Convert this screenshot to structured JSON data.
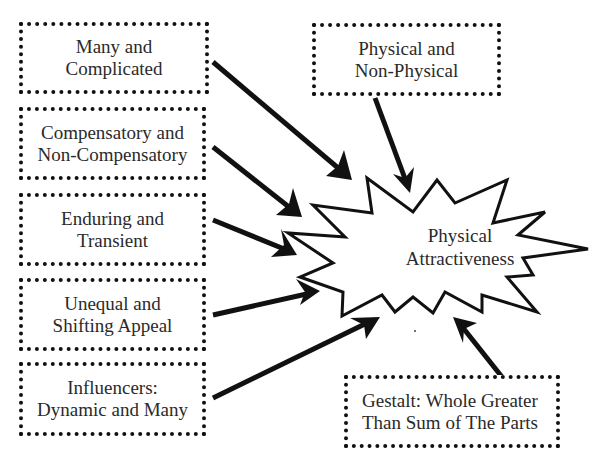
{
  "diagram": {
    "center": {
      "line1": "Physical",
      "line2": "Attractiveness",
      "shape": "starburst"
    },
    "factors": [
      {
        "id": "many",
        "line1": "Many and",
        "line2": "Complicated"
      },
      {
        "id": "compensatory",
        "line1": "Compensatory and",
        "line2": "Non-Compensatory"
      },
      {
        "id": "enduring",
        "line1": "Enduring and",
        "line2": "Transient"
      },
      {
        "id": "unequal",
        "line1": "Unequal and",
        "line2": "Shifting Appeal"
      },
      {
        "id": "influencers",
        "line1": "Influencers:",
        "line2": "Dynamic and Many"
      },
      {
        "id": "physical",
        "line1": "Physical and",
        "line2": "Non-Physical"
      },
      {
        "id": "gestalt",
        "line1": "Gestalt: Whole Greater",
        "line2": "Than Sum of The Parts"
      }
    ],
    "colors": {
      "stroke": "#111111",
      "text": "#2a2a2a",
      "background": "#ffffff"
    }
  }
}
